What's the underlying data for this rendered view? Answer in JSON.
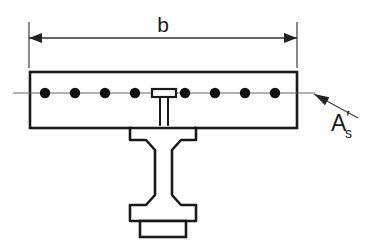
{
  "colors": {
    "line": "#1a1a1a",
    "rebar_fill": "#111111",
    "thin_line": "#555555",
    "background": "#fefefe"
  },
  "dimension": {
    "label": "b",
    "label_x": 163,
    "label_y": 32,
    "line_y": 38,
    "left_x": 29,
    "right_x": 297,
    "extension_top_y": 22,
    "extension_bottom_y": 68
  },
  "slab": {
    "name": "concrete-slab",
    "left": 30,
    "top": 72,
    "right": 297,
    "bottom": 128
  },
  "centerline": {
    "y": 93,
    "start_x": 13,
    "end_x": 315
  },
  "rebar": {
    "name": "reinforcement-bars",
    "count": 8,
    "radius": 5.2,
    "y": 93,
    "x_positions": [
      45,
      75,
      105,
      135,
      185,
      215,
      245,
      275
    ]
  },
  "rebar_callout": {
    "label_main": "A",
    "label_prime": "′",
    "label_sub": "s",
    "label_x": 331,
    "label_y": 131,
    "leader_start_x": 358,
    "leader_start_y": 118,
    "leader_end_x": 314,
    "leader_end_y": 94
  },
  "shear_stud": {
    "name": "shear-stud-connector",
    "head_left": 152,
    "head_right": 176,
    "head_top": 89,
    "head_bottom": 97,
    "shaft_left": 160,
    "shaft_right": 168,
    "shaft_top": 97,
    "shaft_bottom": 128
  },
  "ibeam": {
    "name": "steel-i-beam",
    "top_flange": {
      "left": 130,
      "right": 196,
      "top": 128,
      "bottom": 140
    },
    "bottom_flange": {
      "left": 130,
      "right": 196,
      "top": 205,
      "bottom": 221
    },
    "web": {
      "left": 155,
      "right": 172,
      "top": 140,
      "bottom": 205
    },
    "fillet": 6
  },
  "cover_plate": {
    "name": "bottom-cover-plate",
    "left": 140,
    "right": 186,
    "top": 221,
    "bottom": 237
  }
}
